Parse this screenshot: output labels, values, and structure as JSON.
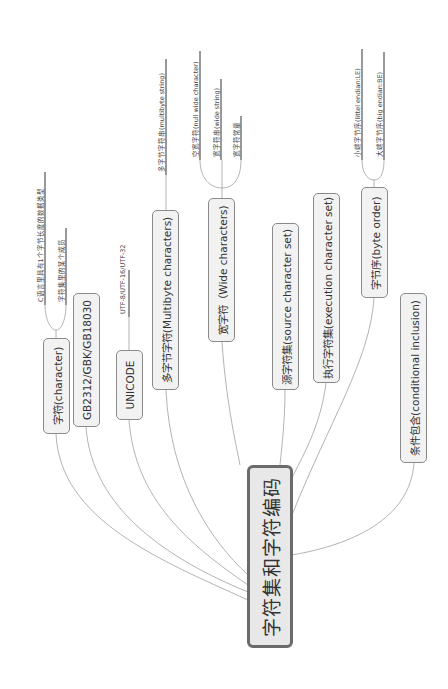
{
  "root": {
    "label": "字符集和字符编码"
  },
  "branches": [
    {
      "label": "字符(character)",
      "children": [
        "C语言里具有1个字节长度的数据类型",
        "字符集里的某个成员"
      ]
    },
    {
      "label": "GB2312/GBK/GB18030",
      "children": []
    },
    {
      "label": "UNICODE",
      "children": [
        "UTF-8/UTF-16/UTF-32"
      ]
    },
    {
      "label": "多字节字符(Multibyte characters)",
      "children": [
        "多字节字符串(multibyte string)"
      ]
    },
    {
      "label": "宽字符（Wide characters)",
      "children": [
        "空宽字符(null wide character)",
        "宽字符串(wide string)",
        "宽字符常量"
      ]
    },
    {
      "label": "源字符集(source character set)",
      "children": []
    },
    {
      "label": "执行字符集(execution character set)",
      "children": []
    },
    {
      "label": "字节序(byte order)",
      "children": [
        "小端字节序(littel endian:LE)",
        "大端字节序(big endian:BE)"
      ]
    },
    {
      "label": "条件包含(conditional inclusion)",
      "children": []
    }
  ],
  "colors": {
    "line": "#9a9a9a",
    "node_fill": "#f2f2f2",
    "node_border": "#8a8a8a",
    "root_border": "#6b6b6b",
    "leaf_underline": "#555555"
  }
}
